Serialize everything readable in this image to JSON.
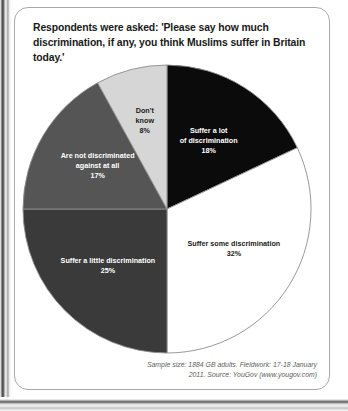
{
  "card": {
    "title": "Respondents were asked: 'Please say how much discrimination, if any, you think Muslims suffer in Britain today.'",
    "source": "Sample size: 1884 GB adults. Fieldwork: 17-18 January 2011. Source: YouGov (www.yougov.com)"
  },
  "chart_data": {
    "type": "pie",
    "title": "Respondents were asked: 'Please say how much discrimination, if any, you think Muslims suffer in Britain today.'",
    "start_angle_deg": 0,
    "direction": "clockwise",
    "total": 100,
    "unit": "%",
    "categories": [
      "Suffer a lot of discrimination",
      "Suffer some discrimination",
      "Suffer a little discrimination",
      "Are not discriminated against at all",
      "Don't know"
    ],
    "values": [
      18,
      32,
      25,
      17,
      8
    ],
    "slices": [
      {
        "label": "Suffer a lot",
        "label_line2": "of discrimination",
        "value": 18,
        "value_text": "18%",
        "color": "#0b0b0b",
        "text_color": "#ffffff",
        "text_tone": "on-dark",
        "label_inside": true,
        "label_r": 0.54,
        "lines": [
          "Suffer a lot",
          "of discrimination",
          "18%"
        ]
      },
      {
        "label": "Suffer some discrimination",
        "value": 32,
        "value_text": "32%",
        "color": "#ffffff",
        "text_color": "#1a1a1a",
        "text_tone": "on-light",
        "label_inside": true,
        "label_r": 0.55,
        "lines": [
          "Suffer some discrimination",
          "32%"
        ]
      },
      {
        "label": "Suffer a little discrimination",
        "value": 25,
        "value_text": "25%",
        "color": "#3a3a3a",
        "text_color": "#ffffff",
        "text_tone": "on-dark",
        "label_inside": true,
        "label_r": 0.58,
        "lines": [
          "Suffer a little discrimination",
          "25%"
        ]
      },
      {
        "label": "Are not discriminated",
        "label_line2": "against at all",
        "value": 17,
        "value_text": "17%",
        "color": "#555555",
        "text_color": "#ffffff",
        "text_tone": "on-dark",
        "label_inside": true,
        "label_r": 0.56,
        "lines": [
          "Are not discriminated",
          "against at all",
          "17%"
        ]
      },
      {
        "label": "Don't know",
        "value": 8,
        "value_text": "8%",
        "color": "#d6d6d6",
        "text_color": "#1a1a1a",
        "text_tone": "on-light",
        "label_inside": true,
        "label_r": 0.62,
        "lines": [
          "Don't",
          "know",
          "8%"
        ]
      }
    ],
    "legend": "inside-slices",
    "grid": false,
    "stroke_color": "#8c8c8c"
  }
}
